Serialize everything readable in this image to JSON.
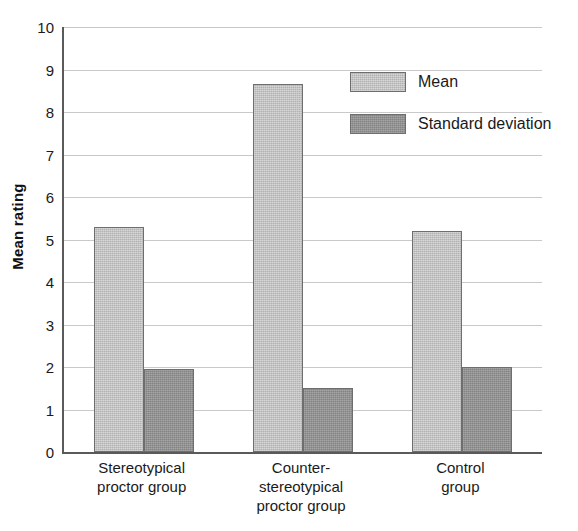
{
  "chart_data": {
    "type": "bar",
    "title": "",
    "subtitle": "",
    "xlabel": "",
    "ylabel": "Mean rating",
    "ylim": [
      0,
      10
    ],
    "ytick_step": 1,
    "yticks": [
      10,
      9,
      8,
      7,
      6,
      5,
      4,
      3,
      2,
      1,
      0
    ],
    "grid": true,
    "grid_axis": "y",
    "legend_position": "upper right",
    "categories": [
      "Stereotypical\nproctor group",
      "Counter-\nstereotypical\nproctor group",
      "Control\ngroup"
    ],
    "series": [
      {
        "name": "Mean",
        "color": "#b2b2b2",
        "values": [
          5.3,
          8.65,
          5.2
        ]
      },
      {
        "name": "Standard deviation",
        "color": "#838383",
        "values": [
          1.95,
          1.5,
          2.0
        ]
      }
    ],
    "axis_color": "#5a5a5a",
    "gridline_color": "#c9c9c9",
    "bar_edge_color": "#6e6e6e",
    "background_color": "#ffffff"
  },
  "legend": {
    "items": [
      {
        "label": "Mean",
        "swatch": "mean"
      },
      {
        "label": "Standard deviation",
        "swatch": "sd"
      }
    ]
  }
}
